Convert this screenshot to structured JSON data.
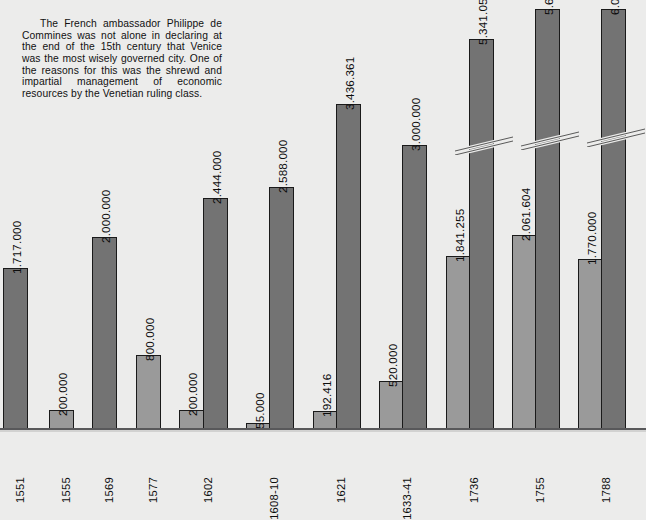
{
  "caption": {
    "text": "The French ambassador Philippe de Commines was not alone in declaring at the end of the 15th century that Venice was the most wisely governed city. One of the reasons for this was the shrewd and impartial management of economic resources by the Venetian ruling class."
  },
  "chart_data": {
    "type": "bar",
    "title": "",
    "xlabel": "",
    "ylabel": "",
    "grid": false,
    "legend": "none",
    "ylim": [
      0,
      6000000
    ],
    "categories": [
      "1551",
      "1555",
      "1569",
      "1577",
      "1602",
      "1608-10",
      "1621",
      "1633-41",
      "1736",
      "1755",
      "1788"
    ],
    "series": [
      {
        "name": "light",
        "values": [
          null,
          200000,
          null,
          800000,
          200000,
          55000,
          192416,
          520000,
          1841255,
          2061604,
          1770000
        ],
        "labels": [
          "",
          "200.000",
          "",
          "800.000",
          "200.000",
          "55.000",
          "192.416",
          "520.000",
          "1.841.255",
          "2.061.604",
          "1.770.000"
        ]
      },
      {
        "name": "dark",
        "values": [
          1717000,
          null,
          2000000,
          null,
          2444000,
          2588000,
          3436361,
          3000000,
          5341059,
          5602095,
          6000000
        ],
        "labels": [
          "1.717.000",
          "",
          "2.000.000",
          "",
          "2.444.000",
          "2.588.000",
          "3.436.361",
          "3.000.000",
          "5.341.059",
          "5.602.095",
          "6.000.000"
        ]
      }
    ],
    "broken_axis_bars": [
      "1736",
      "1755",
      "1788"
    ],
    "colors": {
      "background": "#ececeb",
      "bar_dark": "#737373",
      "bar_light": "#9a9a9a",
      "bar_outline": "#1a1a1a",
      "text": "#0d0d0d",
      "axis": "#58585a"
    }
  },
  "bars": [
    {
      "name": "bar-1551-dark",
      "cat": "1551",
      "tone": "dark",
      "label": "1.717.000",
      "x": 3,
      "w": 25,
      "top": 267,
      "break": false
    },
    {
      "name": "bar-1555-light",
      "cat": "1555",
      "tone": "light",
      "label": "200.000",
      "x": 49,
      "w": 25,
      "top": 409,
      "break": false
    },
    {
      "name": "bar-1569-dark",
      "cat": "1569",
      "tone": "dark",
      "label": "2.000.000",
      "x": 92,
      "w": 25,
      "top": 236,
      "break": false
    },
    {
      "name": "bar-1577-light",
      "cat": "1577",
      "tone": "light",
      "label": "800.000",
      "x": 136,
      "w": 25,
      "top": 354,
      "break": false
    },
    {
      "name": "bar-1602-light",
      "cat": "1602",
      "tone": "light",
      "label": "200.000",
      "x": 179,
      "w": 25,
      "top": 409,
      "break": false
    },
    {
      "name": "bar-1602-dark",
      "cat": "1602",
      "tone": "dark",
      "label": "2.444.000",
      "x": 203,
      "w": 25,
      "top": 197,
      "break": false
    },
    {
      "name": "bar-1608-light",
      "cat": "1608-10",
      "tone": "light",
      "label": "55.000",
      "x": 246,
      "w": 25,
      "top": 422,
      "break": false
    },
    {
      "name": "bar-1608-dark",
      "cat": "1608-10",
      "tone": "dark",
      "label": "2.588.000",
      "x": 269,
      "w": 25,
      "top": 186,
      "break": false
    },
    {
      "name": "bar-1621-light",
      "cat": "1621",
      "tone": "light",
      "label": "192.416",
      "x": 313,
      "w": 25,
      "top": 410,
      "break": false
    },
    {
      "name": "bar-1621-dark",
      "cat": "1621",
      "tone": "dark",
      "label": "3.436.361",
      "x": 336,
      "w": 25,
      "top": 103,
      "break": false
    },
    {
      "name": "bar-1633-light",
      "cat": "1633-41",
      "tone": "light",
      "label": "520.000",
      "x": 379,
      "w": 25,
      "top": 380,
      "break": false
    },
    {
      "name": "bar-1633-dark",
      "cat": "1633-41",
      "tone": "dark",
      "label": "3.000.000",
      "x": 402,
      "w": 25,
      "top": 144,
      "break": false
    },
    {
      "name": "bar-1736-light",
      "cat": "1736",
      "tone": "light",
      "label": "1.841.255",
      "x": 446,
      "w": 25,
      "top": 255,
      "break": false
    },
    {
      "name": "bar-1736-dark",
      "cat": "1736",
      "tone": "dark",
      "label": "5.341.059",
      "x": 469,
      "w": 25,
      "top": 38,
      "break": true
    },
    {
      "name": "bar-1755-light",
      "cat": "1755",
      "tone": "light",
      "label": "2.061.604",
      "x": 512,
      "w": 25,
      "top": 234,
      "break": false
    },
    {
      "name": "bar-1755-dark",
      "cat": "1755",
      "tone": "dark",
      "label": "5.602.095",
      "x": 535,
      "w": 25,
      "top": 8,
      "break": true
    },
    {
      "name": "bar-1788-light",
      "cat": "1788",
      "tone": "light",
      "label": "1.770.000",
      "x": 578,
      "w": 25,
      "top": 258,
      "break": false
    },
    {
      "name": "bar-1788-dark",
      "cat": "1788",
      "tone": "dark",
      "label": "6.000.000",
      "x": 601,
      "w": 25,
      "top": 8,
      "break": true
    }
  ],
  "xlabels": [
    {
      "name": "xlabel-1551",
      "text": "1551",
      "x": 14
    },
    {
      "name": "xlabel-1555",
      "text": "1555",
      "x": 60
    },
    {
      "name": "xlabel-1569",
      "text": "1569",
      "x": 103
    },
    {
      "name": "xlabel-1577",
      "text": "1577",
      "x": 147
    },
    {
      "name": "xlabel-1602",
      "text": "1602",
      "x": 202
    },
    {
      "name": "xlabel-1608-10",
      "text": "1608-10",
      "x": 268
    },
    {
      "name": "xlabel-1621",
      "text": "1621",
      "x": 335
    },
    {
      "name": "xlabel-1633-41",
      "text": "1633-41",
      "x": 401
    },
    {
      "name": "xlabel-1736",
      "text": "1736",
      "x": 468
    },
    {
      "name": "xlabel-1755",
      "text": "1755",
      "x": 534
    },
    {
      "name": "xlabel-1788",
      "text": "1788",
      "x": 600
    }
  ],
  "break_marks": [
    {
      "name": "break-mark-1736",
      "x": 455,
      "y": 133,
      "w": 58
    },
    {
      "name": "break-mark-1755",
      "x": 521,
      "y": 128,
      "w": 58
    },
    {
      "name": "break-mark-1788",
      "x": 587,
      "y": 125,
      "w": 58
    }
  ]
}
